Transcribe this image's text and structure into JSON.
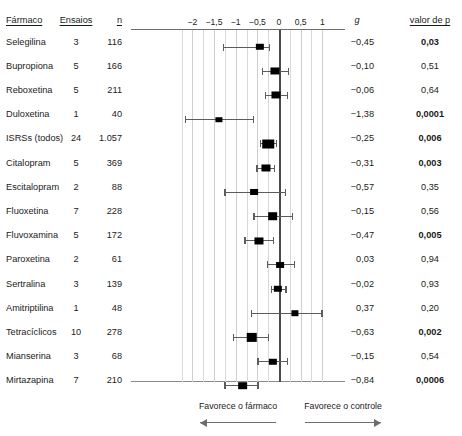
{
  "headers": {
    "drug": "Fármaco",
    "trials": "Ensaios",
    "n": "n",
    "g": "g",
    "p": "valor de p"
  },
  "footer": {
    "left_label": "Favorece o fármaco",
    "right_label": "Favorece o controle",
    "left_arrow": "left-arrow-icon",
    "right_arrow": "right-arrow-icon"
  },
  "chart_data": {
    "type": "forest",
    "title": "",
    "xlabel": "",
    "ylabel": "",
    "xlim": [
      -2.25,
      1.1
    ],
    "grid": true,
    "grid_step": 0.25,
    "tick_values": [
      -2,
      -1.5,
      -1,
      -0.5,
      0,
      0.5,
      1
    ],
    "tick_labels": [
      "−2",
      "−1,5",
      "−1",
      "−0,5",
      "0",
      "0,5",
      "1"
    ],
    "null_line": 0,
    "effect_measure": "g",
    "rows": [
      {
        "drug": "Selegilina",
        "trials": "3",
        "n": "116",
        "g": "−0,45",
        "g_value": -0.45,
        "ci_low": -1.29,
        "ci_high": -0.23,
        "p": "0,03",
        "p_significant": true,
        "weight": 3
      },
      {
        "drug": "Bupropiona",
        "trials": "5",
        "n": "166",
        "g": "−0,10",
        "g_value": -0.1,
        "ci_low": -0.4,
        "ci_high": 0.2,
        "p": "0,51",
        "p_significant": false,
        "weight": 5
      },
      {
        "drug": "Reboxetina",
        "trials": "5",
        "n": "211",
        "g": "−0,06",
        "g_value": -0.06,
        "ci_low": -0.32,
        "ci_high": 0.18,
        "p": "0,64",
        "p_significant": false,
        "weight": 5
      },
      {
        "drug": "Duloxetina",
        "trials": "1",
        "n": "40",
        "g": "−1,38",
        "g_value": -1.38,
        "ci_low": -2.18,
        "ci_high": -0.6,
        "p": "0,0001",
        "p_significant": true,
        "weight": 1
      },
      {
        "drug": "ISRSs (todos)",
        "trials": "24",
        "n": "1.057",
        "g": "−0,25",
        "g_value": -0.25,
        "ci_low": -0.44,
        "ci_high": -0.08,
        "p": "0,006",
        "p_significant": true,
        "weight": 24
      },
      {
        "drug": "Citalopram",
        "trials": "5",
        "n": "369",
        "g": "−0,31",
        "g_value": -0.31,
        "ci_low": -0.52,
        "ci_high": -0.12,
        "p": "0,003",
        "p_significant": true,
        "weight": 5
      },
      {
        "drug": "Escitalopram",
        "trials": "2",
        "n": "88",
        "g": "−0,57",
        "g_value": -0.57,
        "ci_low": -1.26,
        "ci_high": 0.14,
        "p": "0,35",
        "p_significant": false,
        "weight": 2
      },
      {
        "drug": "Fluoxetina",
        "trials": "7",
        "n": "228",
        "g": "−0,15",
        "g_value": -0.15,
        "ci_low": -0.59,
        "ci_high": 0.3,
        "p": "0,56",
        "p_significant": false,
        "weight": 7
      },
      {
        "drug": "Fluvoxamina",
        "trials": "5",
        "n": "172",
        "g": "−0,47",
        "g_value": -0.47,
        "ci_low": -0.8,
        "ci_high": -0.15,
        "p": "0,005",
        "p_significant": true,
        "weight": 5
      },
      {
        "drug": "Paroxetina",
        "trials": "2",
        "n": "61",
        "g": "0,03",
        "g_value": 0.03,
        "ci_low": -0.28,
        "ci_high": 0.34,
        "p": "0,94",
        "p_significant": false,
        "weight": 2
      },
      {
        "drug": "Sertralina",
        "trials": "3",
        "n": "139",
        "g": "−0,02",
        "g_value": -0.02,
        "ci_low": -0.18,
        "ci_high": 0.15,
        "p": "0,93",
        "p_significant": false,
        "weight": 3
      },
      {
        "drug": "Amitriptilina",
        "trials": "1",
        "n": "48",
        "g": "0,37",
        "g_value": 0.37,
        "ci_low": -0.65,
        "ci_high": 0.98,
        "p": "0,20",
        "p_significant": false,
        "weight": 1
      },
      {
        "drug": "Tetracíclicos",
        "trials": "10",
        "n": "278",
        "g": "−0,63",
        "g_value": -0.63,
        "ci_low": -1.06,
        "ci_high": -0.26,
        "p": "0,002",
        "p_significant": true,
        "weight": 10
      },
      {
        "drug": "Mianserina",
        "trials": "3",
        "n": "68",
        "g": "−0,15",
        "g_value": -0.15,
        "ci_low": -0.5,
        "ci_high": 0.18,
        "p": "0,54",
        "p_significant": false,
        "weight": 3
      },
      {
        "drug": "Mirtazapina",
        "trials": "7",
        "n": "210",
        "g": "−0,84",
        "g_value": -0.84,
        "ci_low": -1.26,
        "ci_high": -0.5,
        "p": "0,0006",
        "p_significant": true,
        "weight": 7
      }
    ]
  }
}
